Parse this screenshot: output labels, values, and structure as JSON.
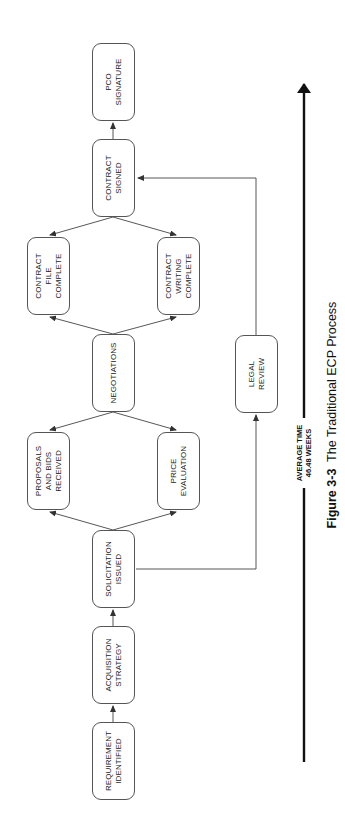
{
  "diagram": {
    "nodes": [
      {
        "id": "requirement",
        "label": "REQUIREMENT\nIDENTIFIED"
      },
      {
        "id": "acquisition",
        "label": "ACQUISITION\nSTRATEGY"
      },
      {
        "id": "solicitation",
        "label": "SOLICITATION\nISSUED"
      },
      {
        "id": "proposals",
        "label": "PROPOSALS\nAND BIDS\nRECEIVED"
      },
      {
        "id": "price",
        "label": "PRICE\nEVALUATION"
      },
      {
        "id": "negotiations",
        "label": "NEGOTIATIONS"
      },
      {
        "id": "contract_file",
        "label": "CONTRACT\nFILE\nCOMPLETE"
      },
      {
        "id": "contract_writing",
        "label": "CONTRACT\nWRITING\nCOMPLETE"
      },
      {
        "id": "contract_signed",
        "label": "CONTRACT\nSIGNED"
      },
      {
        "id": "pco",
        "label": "PCO\nSIGNATURE"
      },
      {
        "id": "legal",
        "label": "LEGAL\nREVIEW"
      }
    ],
    "edges": [
      [
        "requirement",
        "acquisition"
      ],
      [
        "acquisition",
        "solicitation"
      ],
      [
        "solicitation",
        "proposals"
      ],
      [
        "solicitation",
        "price"
      ],
      [
        "negotiations",
        "proposals"
      ],
      [
        "negotiations",
        "price"
      ],
      [
        "negotiations",
        "contract_file"
      ],
      [
        "negotiations",
        "contract_writing"
      ],
      [
        "contract_signed",
        "contract_file"
      ],
      [
        "contract_signed",
        "contract_writing"
      ],
      [
        "contract_signed",
        "pco"
      ],
      [
        "solicitation",
        "legal"
      ],
      [
        "legal",
        "contract_signed"
      ]
    ],
    "timeline": {
      "label": "AVERAGE TIME\n46.48 WEEKS"
    },
    "caption": {
      "figure": "Figure 3-3",
      "title": "The Traditional ECP Process"
    },
    "colors": {
      "line": "#444444",
      "timeline": "#111111",
      "text": "#222222"
    }
  }
}
